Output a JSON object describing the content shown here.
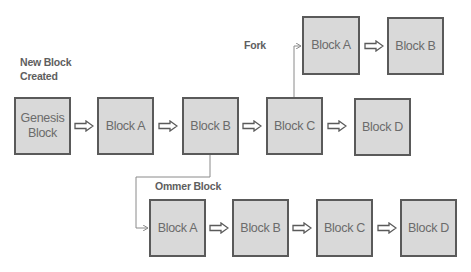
{
  "labels": {
    "new_block": "New Block Created",
    "new_block_line1": "New Block",
    "new_block_line2": "Created",
    "fork": "Fork",
    "ommer": "Ommer Block"
  },
  "main_chain": [
    {
      "label": "Genesis Block",
      "line1": "Genesis",
      "line2": "Block"
    },
    {
      "label": "Block A"
    },
    {
      "label": "Block B"
    },
    {
      "label": "Block C"
    },
    {
      "label": "Block D"
    }
  ],
  "fork_chain": [
    {
      "label": "Block A"
    },
    {
      "label": "Block B"
    }
  ],
  "ommer_chain": [
    {
      "label": "Block A"
    },
    {
      "label": "Block B"
    },
    {
      "label": "Block C"
    },
    {
      "label": "Block D"
    }
  ],
  "colors": {
    "block_fill": "#d9d9d9",
    "block_border": "#5a5a5a",
    "text": "#6b6b6b",
    "connector": "#8a8a8a"
  }
}
